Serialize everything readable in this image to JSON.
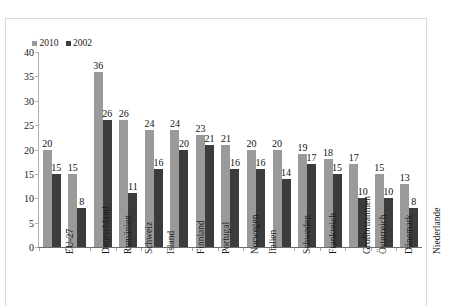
{
  "top_caption": "",
  "legend": {
    "position": "top-left",
    "items": [
      {
        "label": "2010",
        "color": "#9a9a9a",
        "swatch": "square-swatch"
      },
      {
        "label": "2002",
        "color": "#3c3c3c",
        "swatch": "square-swatch"
      }
    ]
  },
  "axis": {
    "y_ticks": [
      "40",
      "35",
      "30",
      "25",
      "20",
      "15",
      "10",
      "5",
      "0"
    ]
  },
  "chart_data": {
    "type": "bar",
    "title": "",
    "xlabel": "",
    "ylabel": "",
    "ylim": [
      0,
      40
    ],
    "ytick_step": 5,
    "grid": false,
    "legend_position": "top-left",
    "categories": [
      "EU-27",
      "Deutschland",
      "Rumänien",
      "Schweiz",
      "Island",
      "Finnland",
      "Portugal",
      "Norwegen",
      "Italien",
      "Schweden",
      "Frankreich",
      "Großbritannien",
      "Österreich",
      "Dänemark",
      "Niederlande"
    ],
    "series": [
      {
        "name": "2010",
        "color": "#9a9a9a",
        "values": [
          20,
          15,
          36,
          26,
          24,
          24,
          23,
          21,
          20,
          20,
          19,
          18,
          17,
          15,
          13
        ]
      },
      {
        "name": "2002",
        "color": "#3c3c3c",
        "values": [
          15,
          8,
          26,
          11,
          16,
          20,
          21,
          16,
          16,
          14,
          17,
          15,
          10,
          10,
          8
        ]
      }
    ]
  }
}
